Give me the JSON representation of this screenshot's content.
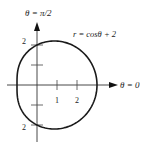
{
  "diagram": {
    "type": "polar-curve",
    "labels": {
      "theta_pi_over_2": "θ = π/2",
      "theta_zero": "θ = 0",
      "equation": "r = cosθ + 2"
    },
    "ticks": {
      "x_1": "1",
      "x_2": "2",
      "y_top": "2",
      "y_bottom": "2"
    },
    "colors": {
      "curve": "#1a1a1a",
      "axis": "#333333"
    }
  },
  "chart_data": {
    "type": "line",
    "title": "",
    "equation": "r = cos(theta) + 2",
    "xlabel": "θ = 0",
    "ylabel": "θ = π/2",
    "x_ticks": [
      1,
      2
    ],
    "y_tick_labels": [
      2,
      -2
    ],
    "xlim": [
      -1.5,
      4
    ],
    "ylim": [
      -2.8,
      3.1
    ],
    "series": [
      {
        "name": "r = cosθ + 2",
        "theta_range": [
          0,
          6.2832
        ],
        "x_extent": [
          -1,
          3
        ],
        "y_extent": [
          -2.6,
          2.6
        ]
      }
    ],
    "grid": false
  }
}
